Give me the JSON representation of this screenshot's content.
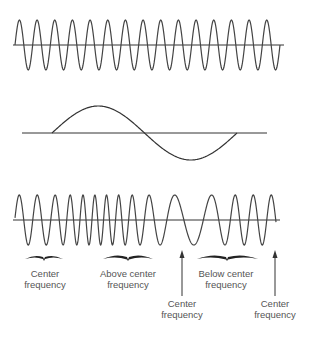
{
  "diagram": {
    "panels": [
      {
        "name": "carrier",
        "description": "Constant-frequency carrier sine wave",
        "cycles": 15
      },
      {
        "name": "modulating-signal",
        "description": "Single cycle of modulating sine wave"
      },
      {
        "name": "fm-wave",
        "description": "Frequency-modulated carrier"
      }
    ],
    "labels": {
      "center1": [
        "Center",
        "frequency"
      ],
      "above": [
        "Above center",
        "frequency"
      ],
      "below": [
        "Below center",
        "frequency"
      ],
      "center_arrow1": [
        "Center",
        "frequency"
      ],
      "center_arrow2": [
        "Center",
        "frequency"
      ]
    },
    "colors": {
      "line": "#333333",
      "text": "#555555"
    }
  }
}
